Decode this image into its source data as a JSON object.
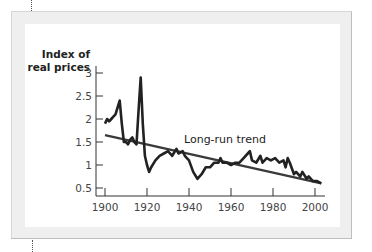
{
  "chart_data": {
    "type": "line",
    "title": "",
    "ylabel": "Index of real prices",
    "xlabel": "",
    "ylim": [
      0.5,
      3
    ],
    "xlim": [
      1900,
      2003
    ],
    "grid": false,
    "legend": "none",
    "yticks": [
      "0.5",
      "1",
      "1.5",
      "2",
      "2.5",
      "3"
    ],
    "xticks": [
      "1900",
      "1920",
      "1940",
      "1960",
      "1980",
      "2000"
    ],
    "annotations": [
      "Long-run trend"
    ],
    "series": [
      {
        "name": "Index of real prices",
        "x": [
          1900,
          1901,
          1902,
          1903,
          1904,
          1905,
          1906,
          1907,
          1908,
          1909,
          1910,
          1911,
          1912,
          1913,
          1914,
          1915,
          1916,
          1917,
          1918,
          1919,
          1920,
          1921,
          1922,
          1924,
          1926,
          1928,
          1930,
          1932,
          1934,
          1935,
          1937,
          1938,
          1940,
          1942,
          1944,
          1946,
          1948,
          1950,
          1952,
          1954,
          1955,
          1956,
          1958,
          1960,
          1962,
          1964,
          1966,
          1968,
          1969,
          1970,
          1972,
          1974,
          1975,
          1977,
          1979,
          1981,
          1983,
          1985,
          1986,
          1987,
          1988,
          1990,
          1991,
          1993,
          1994,
          1996,
          1997,
          1999,
          2001,
          2003
        ],
        "values": [
          1.9,
          2.0,
          1.95,
          2.0,
          2.05,
          2.1,
          2.25,
          2.4,
          1.9,
          1.5,
          1.5,
          1.45,
          1.55,
          1.6,
          1.5,
          1.45,
          2.2,
          2.9,
          1.9,
          1.2,
          1.0,
          0.85,
          0.95,
          1.1,
          1.2,
          1.25,
          1.3,
          1.2,
          1.35,
          1.25,
          1.3,
          1.2,
          1.1,
          0.85,
          0.7,
          0.8,
          0.95,
          0.95,
          1.05,
          1.05,
          1.15,
          1.05,
          1.05,
          1.0,
          1.05,
          1.05,
          1.15,
          1.25,
          1.3,
          1.1,
          1.05,
          1.2,
          1.05,
          1.15,
          1.1,
          1.15,
          1.05,
          1.1,
          0.95,
          1.15,
          1.05,
          0.8,
          0.85,
          0.75,
          0.85,
          0.7,
          0.75,
          0.65,
          0.65,
          0.6
        ]
      },
      {
        "name": "Long-run trend",
        "x": [
          1900,
          2003
        ],
        "values": [
          1.65,
          0.6
        ]
      }
    ]
  },
  "labels": {
    "ylabel_line1": "Index of",
    "ylabel_line2": "real prices",
    "trend": "Long-run trend"
  }
}
